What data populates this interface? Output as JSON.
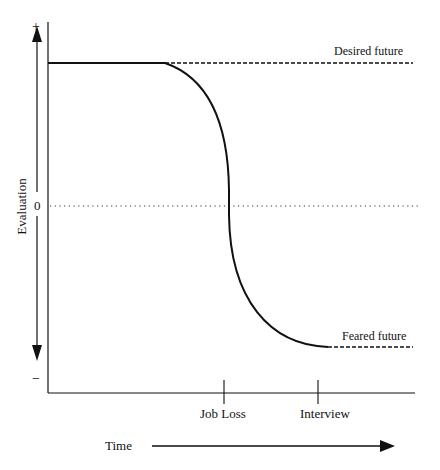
{
  "diagram": {
    "type": "evaluation-over-time",
    "y_axis": {
      "label": "Evaluation",
      "top_sign": "+",
      "bottom_sign": "−",
      "zero_label": "0"
    },
    "x_axis": {
      "label": "Time",
      "ticks": [
        {
          "label": "Job Loss"
        },
        {
          "label": "Interview"
        }
      ]
    },
    "annotations": {
      "desired": "Desired future",
      "feared": "Feared future"
    }
  },
  "colors": {
    "line": "#111111",
    "background": "#ffffff"
  }
}
